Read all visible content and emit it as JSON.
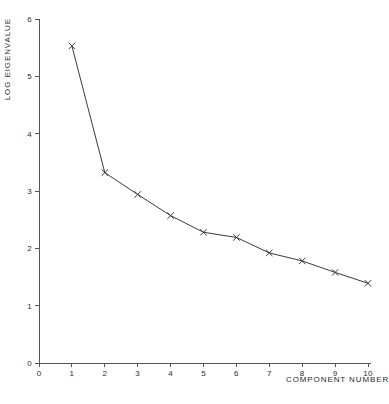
{
  "chart_data": {
    "type": "line",
    "title": "",
    "xlabel": "COMPONENT NUMBER",
    "ylabel": "LOG EIGENVALUE",
    "x": [
      1,
      2,
      3,
      4,
      5,
      6,
      7,
      8,
      9,
      10
    ],
    "values": [
      5.53,
      3.32,
      2.94,
      2.57,
      2.28,
      2.19,
      1.92,
      1.78,
      1.58,
      1.39
    ],
    "series": [
      {
        "name": "Log eigenvalue",
        "values": [
          5.53,
          3.32,
          2.94,
          2.57,
          2.28,
          2.19,
          1.92,
          1.78,
          1.58,
          1.39
        ]
      }
    ],
    "xlim": [
      0,
      10
    ],
    "ylim": [
      0,
      6
    ],
    "xticks": [
      "0",
      "1",
      "2",
      "3",
      "4",
      "5",
      "6",
      "7",
      "8",
      "9",
      "10"
    ],
    "yticks": [
      "0",
      "1",
      "2",
      "3",
      "4",
      "5",
      "6"
    ],
    "xtick_values": [
      0,
      1,
      2,
      3,
      4,
      5,
      6,
      7,
      8,
      9,
      10
    ],
    "ytick_values": [
      0,
      1,
      2,
      3,
      4,
      5,
      6
    ],
    "grid": false,
    "legend": null,
    "marker": "x",
    "line_color": "#3a3a3a",
    "marker_color": "#3a3a3a",
    "axis_color": "#555555",
    "background": "#ffffff"
  },
  "axes": {
    "y_axis_title": "LOG EIGENVALUE",
    "x_axis_title": "COMPONENT NUMBER"
  }
}
